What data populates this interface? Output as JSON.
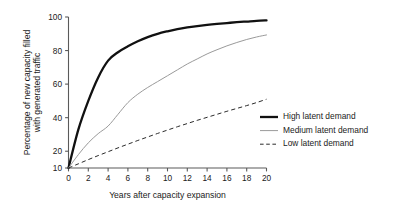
{
  "chart_data": {
    "type": "line",
    "title": "",
    "xlabel": "Years after capacity expansion",
    "ylabel": "Percentage of new capacity filled with generated traffic",
    "ylabel_lines": [
      "Percentage of new capacity filled",
      "with generated traffic"
    ],
    "xlim": [
      0,
      20
    ],
    "ylim": [
      10,
      100
    ],
    "xticks": [
      0,
      2,
      4,
      6,
      8,
      10,
      12,
      14,
      16,
      18,
      20
    ],
    "xticklabels": [
      "0",
      "2",
      "4",
      "6",
      "8",
      "10",
      "12",
      "14",
      "16",
      "18",
      "20"
    ],
    "yticks": [
      10,
      20,
      40,
      60,
      80,
      100
    ],
    "yticklabels": [
      "10",
      "20",
      "40",
      "60",
      "80",
      "100"
    ],
    "grid": false,
    "legend_position": "center-right",
    "x": [
      0,
      1,
      2,
      3,
      4,
      5,
      6,
      7,
      8,
      9,
      10,
      11,
      12,
      13,
      14,
      15,
      16,
      17,
      18,
      19,
      20
    ],
    "series": [
      {
        "name": "High latent demand",
        "style": "solid-thick",
        "color": "#111111",
        "values": [
          10,
          33,
          50,
          64,
          74,
          79,
          82.5,
          85.5,
          88,
          90,
          91.5,
          92.8,
          93.8,
          94.6,
          95.3,
          95.9,
          96.4,
          96.9,
          97.3,
          97.7,
          98
        ]
      },
      {
        "name": "Medium latent demand",
        "style": "solid-thin",
        "color": "#9a9a9a",
        "values": [
          10,
          18,
          25,
          30.5,
          35,
          42,
          49,
          54,
          58,
          61.5,
          65,
          68.5,
          72,
          75,
          78,
          80.5,
          82.8,
          84.8,
          86.6,
          88.1,
          89.3
        ]
      },
      {
        "name": "Low latent demand",
        "style": "dashed",
        "color": "#2b2b2b",
        "values": [
          10,
          12.5,
          15,
          17.4,
          19.7,
          22,
          24.2,
          26.4,
          28.5,
          30.6,
          32.6,
          34.6,
          36.5,
          38.4,
          40.2,
          42,
          43.8,
          45.5,
          47.2,
          49,
          51
        ]
      }
    ]
  }
}
